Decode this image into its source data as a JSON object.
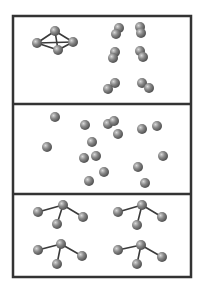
{
  "diagram": {
    "width": 201,
    "height": 290,
    "colors": {
      "background": "#ffffff",
      "frame": "#333333",
      "atom_light": "#d8d8d8",
      "atom_mid": "#8a8a8a",
      "atom_dark": "#4a4a4a",
      "bond": "#3a3a3a"
    },
    "frame": {
      "x": 13,
      "y": 16,
      "width": 178,
      "height": 261,
      "stroke_width": 2.5
    },
    "dividers": [
      104,
      194
    ],
    "panels": [
      {
        "name": "top-panel",
        "description": "one tetrahedral molecule and six diatomic molecules",
        "molecules": [
          {
            "name": "tetrahedral-molecule",
            "atoms": [
              [
                55,
                31,
                5
              ],
              [
                37,
                43,
                5
              ],
              [
                73,
                42,
                5
              ],
              [
                58,
                50,
                5
              ]
            ],
            "bonds": [
              [
                0,
                1
              ],
              [
                0,
                2
              ],
              [
                0,
                3
              ],
              [
                1,
                2
              ],
              [
                1,
                3
              ],
              [
                2,
                3
              ]
            ]
          },
          {
            "name": "diatomic-molecule",
            "atoms": [
              [
                119,
                28,
                5
              ],
              [
                116,
                34,
                5
              ]
            ],
            "bonds": []
          },
          {
            "name": "diatomic-molecule",
            "atoms": [
              [
                140,
                27,
                5
              ],
              [
                141,
                33,
                5
              ]
            ],
            "bonds": []
          },
          {
            "name": "diatomic-molecule",
            "atoms": [
              [
                115,
                52,
                5
              ],
              [
                113,
                58,
                5
              ]
            ],
            "bonds": []
          },
          {
            "name": "diatomic-molecule",
            "atoms": [
              [
                140,
                51,
                5
              ],
              [
                143,
                57,
                5
              ]
            ],
            "bonds": []
          },
          {
            "name": "diatomic-molecule",
            "atoms": [
              [
                115,
                83,
                5
              ],
              [
                108,
                89,
                5
              ]
            ],
            "bonds": []
          },
          {
            "name": "diatomic-molecule",
            "atoms": [
              [
                142,
                83,
                5
              ],
              [
                149,
                88,
                5
              ]
            ],
            "bonds": []
          }
        ]
      },
      {
        "name": "middle-panel",
        "description": "separated single atoms",
        "molecules": [
          {
            "name": "single-atom",
            "atoms": [
              [
                55,
                117,
                5
              ]
            ],
            "bonds": []
          },
          {
            "name": "single-atom",
            "atoms": [
              [
                85,
                125,
                5
              ]
            ],
            "bonds": []
          },
          {
            "name": "single-atom",
            "atoms": [
              [
                108,
                124,
                5
              ]
            ],
            "bonds": []
          },
          {
            "name": "single-atom",
            "atoms": [
              [
                114,
                121,
                5
              ]
            ],
            "bonds": []
          },
          {
            "name": "single-atom",
            "atoms": [
              [
                118,
                134,
                5
              ]
            ],
            "bonds": []
          },
          {
            "name": "single-atom",
            "atoms": [
              [
                142,
                129,
                5
              ]
            ],
            "bonds": []
          },
          {
            "name": "single-atom",
            "atoms": [
              [
                157,
                126,
                5
              ]
            ],
            "bonds": []
          },
          {
            "name": "single-atom",
            "atoms": [
              [
                92,
                142,
                5
              ]
            ],
            "bonds": []
          },
          {
            "name": "single-atom",
            "atoms": [
              [
                47,
                147,
                5
              ]
            ],
            "bonds": []
          },
          {
            "name": "single-atom",
            "atoms": [
              [
                84,
                158,
                5
              ]
            ],
            "bonds": []
          },
          {
            "name": "single-atom",
            "atoms": [
              [
                96,
                156,
                5
              ]
            ],
            "bonds": []
          },
          {
            "name": "single-atom",
            "atoms": [
              [
                163,
                156,
                5
              ]
            ],
            "bonds": []
          },
          {
            "name": "single-atom",
            "atoms": [
              [
                138,
                167,
                5
              ]
            ],
            "bonds": []
          },
          {
            "name": "single-atom",
            "atoms": [
              [
                104,
                172,
                5
              ]
            ],
            "bonds": []
          },
          {
            "name": "single-atom",
            "atoms": [
              [
                89,
                181,
                5
              ]
            ],
            "bonds": []
          },
          {
            "name": "single-atom",
            "atoms": [
              [
                145,
                183,
                5
              ]
            ],
            "bonds": []
          }
        ]
      },
      {
        "name": "bottom-panel",
        "description": "four trigonal pyramidal molecules",
        "molecules": [
          {
            "name": "pyramidal-molecule",
            "atoms": [
              [
                63,
                205,
                5
              ],
              [
                38,
                212,
                5
              ],
              [
                57,
                224,
                5
              ],
              [
                83,
                217,
                5
              ]
            ],
            "bonds": [
              [
                0,
                1
              ],
              [
                0,
                2
              ],
              [
                0,
                3
              ]
            ]
          },
          {
            "name": "pyramidal-molecule",
            "atoms": [
              [
                142,
                205,
                5
              ],
              [
                118,
                212,
                5
              ],
              [
                137,
                225,
                5
              ],
              [
                162,
                217,
                5
              ]
            ],
            "bonds": [
              [
                0,
                1
              ],
              [
                0,
                2
              ],
              [
                0,
                3
              ]
            ]
          },
          {
            "name": "pyramidal-molecule",
            "atoms": [
              [
                61,
                244,
                5
              ],
              [
                38,
                250,
                5
              ],
              [
                57,
                264,
                5
              ],
              [
                82,
                256,
                5
              ]
            ],
            "bonds": [
              [
                0,
                1
              ],
              [
                0,
                2
              ],
              [
                0,
                3
              ]
            ]
          },
          {
            "name": "pyramidal-molecule",
            "atoms": [
              [
                141,
                245,
                5
              ],
              [
                118,
                250,
                5
              ],
              [
                137,
                264,
                5
              ],
              [
                162,
                257,
                5
              ]
            ],
            "bonds": [
              [
                0,
                1
              ],
              [
                0,
                2
              ],
              [
                0,
                3
              ]
            ]
          }
        ]
      }
    ]
  }
}
